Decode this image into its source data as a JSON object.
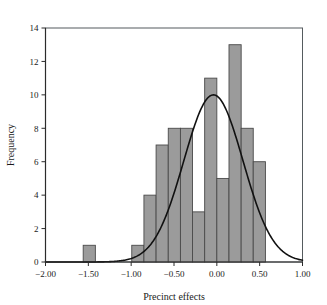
{
  "chart_data": {
    "type": "bar",
    "title": "",
    "subtitle": "",
    "xlabel": "Precinct effects",
    "ylabel": "Frequency",
    "xlim": [
      -2.0,
      1.0
    ],
    "ylim": [
      0,
      14
    ],
    "grid": false,
    "legend": null,
    "bin_width": 0.1417,
    "x_ticks": [
      -2.0,
      -1.5,
      -1.0,
      -0.5,
      0.0,
      0.5,
      1.0
    ],
    "x_tick_labels": [
      "−2.00",
      "−1.50",
      "−1.00",
      "−0.50",
      "0.00",
      "0.50",
      "1.00"
    ],
    "y_ticks": [
      0,
      2,
      4,
      6,
      8,
      10,
      12,
      14
    ],
    "y_tick_labels": [
      "0",
      "2",
      "4",
      "6",
      "8",
      "10",
      "12",
      "14"
    ],
    "bars": [
      {
        "x_left": -1.56,
        "x_right": -1.418,
        "value": 1
      },
      {
        "x_left": -0.993,
        "x_right": -0.851,
        "value": 1
      },
      {
        "x_left": -0.851,
        "x_right": -0.709,
        "value": 4
      },
      {
        "x_left": -0.709,
        "x_right": -0.567,
        "value": 7
      },
      {
        "x_left": -0.567,
        "x_right": -0.425,
        "value": 8
      },
      {
        "x_left": -0.425,
        "x_right": -0.284,
        "value": 8
      },
      {
        "x_left": -0.284,
        "x_right": -0.142,
        "value": 3
      },
      {
        "x_left": -0.142,
        "x_right": 0.0,
        "value": 11
      },
      {
        "x_left": 0.0,
        "x_right": 0.142,
        "value": 5
      },
      {
        "x_left": 0.142,
        "x_right": 0.284,
        "value": 13
      },
      {
        "x_left": 0.284,
        "x_right": 0.425,
        "value": 8
      },
      {
        "x_left": 0.425,
        "x_right": 0.567,
        "value": 6
      }
    ],
    "bar_values": [
      1,
      1,
      4,
      7,
      8,
      8,
      3,
      11,
      5,
      13,
      8,
      6
    ],
    "overlay_curve": {
      "type": "normal-density",
      "label": "normal fit",
      "mean": -0.04,
      "sigma": 0.345,
      "peak_value": 10.0,
      "peak_x": -0.04
    },
    "colors": {
      "bar_fill": "#9b9b9b",
      "bar_edge": "#4a4a4a",
      "curve": "#111111",
      "axis": "#2b2b2b",
      "frame": "#555b5e",
      "background": "#ffffff"
    }
  }
}
